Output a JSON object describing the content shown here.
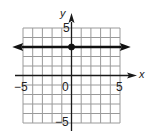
{
  "chart_data": {
    "type": "line",
    "title": "",
    "xlabel": "x",
    "ylabel": "y",
    "xlim": [
      -5,
      5
    ],
    "ylim": [
      -5,
      5
    ],
    "grid": true,
    "grid_step": 1,
    "x_tick_labels": [
      "-5",
      "0",
      "5"
    ],
    "y_tick_labels": [
      "5",
      "-5"
    ],
    "series": [
      {
        "name": "y = 3",
        "equation": "y = 3",
        "x": [
          -5.8,
          5.8
        ],
        "values": [
          3,
          3
        ],
        "arrows": "both"
      }
    ],
    "points": [
      {
        "x": 0,
        "y": 3,
        "filled": true
      }
    ]
  },
  "labels": {
    "x_axis": "x",
    "y_axis": "y",
    "x_neg5": "−5",
    "x_zero": "0",
    "x_pos5": "5",
    "y_pos5": "5",
    "y_neg5": "−5"
  },
  "colors": {
    "grid": "#9a9a9a",
    "axis": "#1a1a1a",
    "line": "#111111"
  }
}
